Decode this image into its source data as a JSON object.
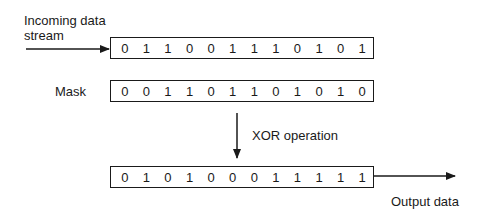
{
  "labels": {
    "incoming": "Incoming data stream",
    "incoming_line1": "Incoming data",
    "incoming_line2": "stream",
    "mask": "Mask",
    "operation": "XOR operation",
    "output": "Output data"
  },
  "rows": {
    "input_bits": [
      "0",
      "1",
      "1",
      "0",
      "0",
      "1",
      "1",
      "1",
      "0",
      "1",
      "0",
      "1"
    ],
    "mask_bits": [
      "0",
      "0",
      "1",
      "1",
      "0",
      "1",
      "1",
      "0",
      "1",
      "0",
      "1",
      "0"
    ],
    "output_bits": [
      "0",
      "1",
      "0",
      "1",
      "0",
      "0",
      "0",
      "1",
      "1",
      "1",
      "1",
      "1"
    ]
  },
  "colors": {
    "stroke": "#1a1a1a",
    "background": "#ffffff"
  }
}
